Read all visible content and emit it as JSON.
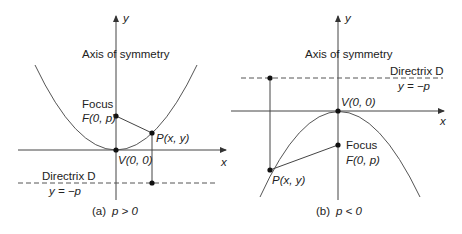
{
  "panels": [
    {
      "id": "a",
      "caption_prefix": "(a)",
      "caption_condition": "p > 0",
      "y_axis_label": "y",
      "x_axis_label": "x",
      "axis_of_symmetry_label": "Axis of symmetry",
      "focus_label": "Focus",
      "focus_coords": "F(0, p)",
      "point_label": "P(x, y)",
      "vertex_label": "V(0, 0)",
      "directrix_label": "Directrix D",
      "directrix_equation": "y = −p"
    },
    {
      "id": "b",
      "caption_prefix": "(b)",
      "caption_condition": "p < 0",
      "y_axis_label": "y",
      "x_axis_label": "x",
      "axis_of_symmetry_label": "Axis of symmetry",
      "focus_label": "Focus",
      "focus_coords": "F(0, p)",
      "point_label": "P(x, y)",
      "vertex_label": "V(0, 0)",
      "directrix_label": "Directrix D",
      "directrix_equation": "y = −p"
    }
  ],
  "colors": {
    "line": "#333333",
    "dot": "#111111"
  }
}
